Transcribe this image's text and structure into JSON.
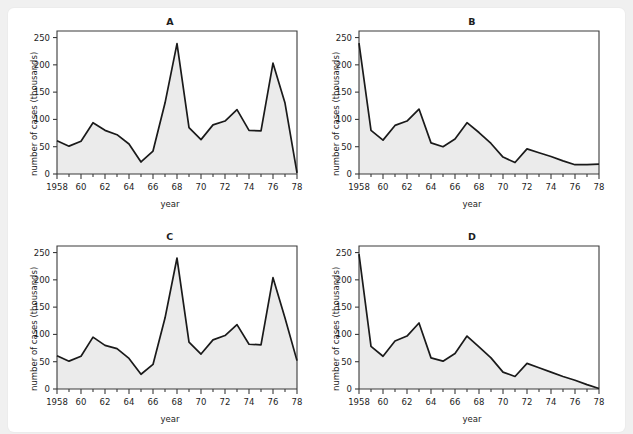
{
  "page": {
    "top_caption": "",
    "background_color": "#f0f0f0",
    "card_color": "#ffffff"
  },
  "style": {
    "line_color": "#1a1a1a",
    "fill_color": "#ebebeb",
    "axis_color": "#3a3a3a",
    "text_color": "#1d1d1d"
  },
  "axes": {
    "xlabel": "year",
    "ylabel": "number of cases (thousands)",
    "y_ticks": [
      0,
      50,
      100,
      150,
      200,
      250
    ],
    "x_tick_labels": [
      "1958",
      "60",
      "62",
      "64",
      "66",
      "68",
      "70",
      "72",
      "74",
      "76",
      "78"
    ],
    "x_tick_values": [
      1958,
      1960,
      1962,
      1964,
      1966,
      1968,
      1970,
      1972,
      1974,
      1976,
      1978
    ],
    "xlim": [
      1958,
      1978
    ],
    "ylim": [
      0,
      262
    ],
    "grid": false
  },
  "chart_data": [
    {
      "id": "A",
      "title": "A",
      "type": "area",
      "xlabel": "year",
      "ylabel": "number of cases (thousands)",
      "xlim": [
        1958,
        1978
      ],
      "ylim": [
        0,
        262
      ],
      "grid": false,
      "x": [
        1958,
        1959,
        1960,
        1961,
        1962,
        1963,
        1964,
        1965,
        1966,
        1967,
        1968,
        1969,
        1970,
        1971,
        1972,
        1973,
        1974,
        1975,
        1976,
        1977,
        1978
      ],
      "values": [
        61,
        51,
        60,
        94,
        80,
        72,
        55,
        22,
        42,
        130,
        239,
        85,
        63,
        90,
        97,
        118,
        80,
        79,
        203,
        130,
        2
      ]
    },
    {
      "id": "B",
      "title": "B",
      "type": "area",
      "xlabel": "year",
      "ylabel": "number of cases (thousands)",
      "xlim": [
        1958,
        1978
      ],
      "ylim": [
        0,
        262
      ],
      "grid": false,
      "x": [
        1958,
        1959,
        1960,
        1961,
        1962,
        1963,
        1964,
        1965,
        1966,
        1967,
        1968,
        1969,
        1970,
        1971,
        1972,
        1973,
        1974,
        1975,
        1976,
        1977,
        1978
      ],
      "values": [
        240,
        80,
        62,
        89,
        97,
        119,
        57,
        50,
        64,
        94,
        76,
        56,
        31,
        21,
        46,
        39,
        32,
        24,
        17,
        17,
        18
      ]
    },
    {
      "id": "C",
      "title": "C",
      "type": "area",
      "xlabel": "year",
      "ylabel": "number of cases (thousands)",
      "xlim": [
        1958,
        1978
      ],
      "ylim": [
        0,
        262
      ],
      "grid": false,
      "x": [
        1958,
        1959,
        1960,
        1961,
        1962,
        1963,
        1964,
        1965,
        1966,
        1967,
        1968,
        1969,
        1970,
        1971,
        1972,
        1973,
        1974,
        1975,
        1976,
        1977,
        1978
      ],
      "values": [
        61,
        51,
        60,
        95,
        80,
        74,
        56,
        27,
        45,
        130,
        240,
        86,
        64,
        90,
        98,
        118,
        82,
        81,
        204,
        130,
        52
      ]
    },
    {
      "id": "D",
      "title": "D",
      "type": "area",
      "xlabel": "year",
      "ylabel": "number of cases (thousands)",
      "xlim": [
        1958,
        1978
      ],
      "ylim": [
        0,
        262
      ],
      "grid": false,
      "x": [
        1958,
        1959,
        1960,
        1961,
        1962,
        1963,
        1964,
        1965,
        1966,
        1967,
        1968,
        1969,
        1970,
        1971,
        1972,
        1973,
        1974,
        1975,
        1976,
        1977,
        1978
      ],
      "values": [
        247,
        78,
        60,
        88,
        97,
        121,
        57,
        51,
        65,
        97,
        77,
        57,
        31,
        23,
        47,
        39,
        31,
        23,
        16,
        8,
        1
      ]
    }
  ]
}
